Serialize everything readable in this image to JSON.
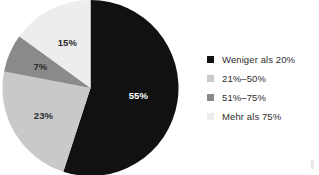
{
  "chart_data": {
    "type": "pie",
    "title": "",
    "subtitle": "",
    "xlabel": "",
    "ylabel": "",
    "legend_position": "right",
    "grid": false,
    "start_angle_deg": 0,
    "direction": "clockwise",
    "categories": [
      "Weniger als 20%",
      "21%–50%",
      "51%–75%",
      "Mehr als 75%"
    ],
    "values": [
      55,
      23,
      7,
      15
    ],
    "value_unit": "%",
    "slices": [
      {
        "label": "Weniger als 20%",
        "value": 55,
        "value_text": "55%",
        "color": "#111111",
        "label_text_color": "#ffffff"
      },
      {
        "label": "21%–50%",
        "value": 23,
        "value_text": "23%",
        "color": "#c9c9c9",
        "label_text_color": "#2b2b2b"
      },
      {
        "label": "51%–75%",
        "value": 7,
        "value_text": "7%",
        "color": "#8a8a8a",
        "label_text_color": "#2b2b2b"
      },
      {
        "label": "Mehr als 75%",
        "value": 15,
        "value_text": "15%",
        "color": "#ededed",
        "label_text_color": "#2b2b2b"
      }
    ]
  },
  "legend": {
    "items": [
      {
        "label": "Weniger als 20%",
        "color": "#111111"
      },
      {
        "label": "21%–50%",
        "color": "#c9c9c9"
      },
      {
        "label": "51%–75%",
        "color": "#8a8a8a"
      },
      {
        "label": "Mehr als 75%",
        "color": "#ededed"
      }
    ]
  }
}
